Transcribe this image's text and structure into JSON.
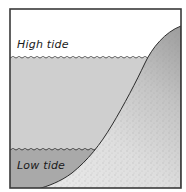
{
  "diagram": {
    "labels": {
      "high_tide": "High tide",
      "low_tide": "Low tide"
    },
    "colors": {
      "frame": "#3a3a3a",
      "sky": "#ffffff",
      "high_tide_water": "#cfcfcf",
      "low_tide_water": "#a9a9a9",
      "shore_light": "#e2e2e2",
      "shore_dark": "#a4a4a4",
      "waterline": "#333333"
    }
  }
}
